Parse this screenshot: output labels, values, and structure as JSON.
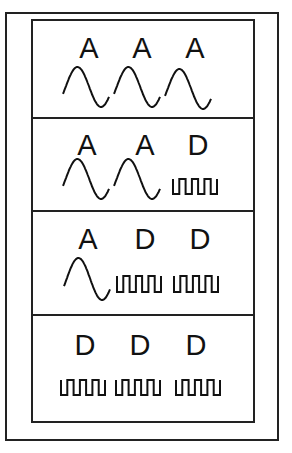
{
  "figure": {
    "title": "",
    "rows": [
      {
        "labels": [
          "A",
          "A",
          "A"
        ],
        "signals": [
          "analog",
          "analog",
          "analog"
        ]
      },
      {
        "labels": [
          "A",
          "A",
          "D"
        ],
        "signals": [
          "analog",
          "analog",
          "digital"
        ]
      },
      {
        "labels": [
          "A",
          "D",
          "D"
        ],
        "signals": [
          "analog",
          "digital",
          "digital"
        ]
      },
      {
        "labels": [
          "D",
          "D",
          "D"
        ],
        "signals": [
          "digital",
          "digital",
          "digital"
        ]
      }
    ],
    "legend": {
      "A": "sine-wave (analog)",
      "D": "square-wave (digital)"
    },
    "colors": {
      "stroke": "#222222",
      "background": "#ffffff"
    }
  }
}
